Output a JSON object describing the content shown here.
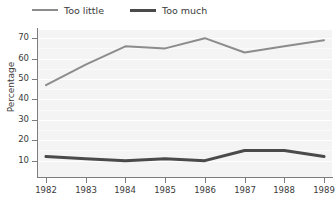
{
  "chart_data": {
    "type": "line",
    "title": "",
    "xlabel": "",
    "ylabel": "Percentage",
    "x": [
      1982,
      1983,
      1984,
      1985,
      1986,
      1987,
      1988,
      1989
    ],
    "categories": [
      "1982",
      "1983",
      "1984",
      "1985",
      "1986",
      "1987",
      "1988",
      "1989"
    ],
    "series": [
      {
        "name": "Too little",
        "color": "#8c8c8c",
        "line_width": 2,
        "values": [
          47,
          57,
          66,
          65,
          70,
          63,
          66,
          69
        ]
      },
      {
        "name": "Too much",
        "color": "#4a4a4a",
        "line_width": 3,
        "values": [
          12,
          11,
          10,
          11,
          10,
          15,
          15,
          12
        ]
      }
    ],
    "ylim": [
      2,
      74
    ],
    "yticks": [
      10,
      20,
      30,
      40,
      50,
      60,
      70
    ],
    "ytick_labels": [
      "10",
      "20",
      "30",
      "40",
      "50",
      "60",
      "70"
    ],
    "xlim": [
      1981.8,
      1989.2
    ],
    "grid": true,
    "grid_color": "#ffffff",
    "plot_background": "#f4f4f4",
    "legend_position": "top-left"
  },
  "legend": {
    "entries": [
      {
        "label": "Too little",
        "color": "#8c8c8c"
      },
      {
        "label": "Too much",
        "color": "#4a4a4a"
      }
    ]
  },
  "axes": {
    "y_axis_label": "Percentage",
    "y_tick_labels": [
      "70",
      "60",
      "50",
      "40",
      "30",
      "20",
      "10"
    ],
    "x_tick_labels": [
      "1982",
      "1983",
      "1984",
      "1985",
      "1986",
      "1987",
      "1988",
      "1989"
    ]
  }
}
